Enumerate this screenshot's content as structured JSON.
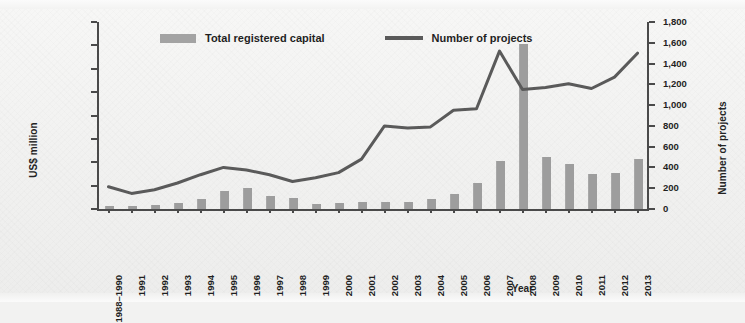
{
  "chart_data": {
    "type": "bar",
    "title": "",
    "xlabel": "Year",
    "ylabel": "US$ million",
    "y2label": "Number of projects",
    "grid": false,
    "legend_position": "top-center",
    "categories": [
      "1988–1990",
      "1991",
      "1992",
      "1993",
      "1994",
      "1995",
      "1996",
      "1997",
      "1998",
      "1999",
      "2000",
      "2001",
      "2002",
      "2003",
      "2004",
      "2005",
      "2006",
      "2007",
      "2008",
      "2009",
      "2010",
      "2011",
      "2012",
      "2013"
    ],
    "ylim": [
      0,
      80000
    ],
    "yticks": [
      0,
      10000,
      20000,
      30000,
      40000,
      50000,
      60000,
      70000,
      80000
    ],
    "ytick_labels": [
      "0",
      "10,000",
      "20,000",
      "30,000",
      "40,000",
      "50,000",
      "60,000",
      "70,000",
      "80,000"
    ],
    "y2lim": [
      0,
      1800
    ],
    "y2ticks": [
      0,
      200,
      400,
      600,
      800,
      1000,
      1200,
      1400,
      1600,
      1800
    ],
    "y2tick_labels": [
      "0",
      "200",
      "400",
      "600",
      "800",
      "1,000",
      "1,200",
      "1,400",
      "1,600",
      "1,800"
    ],
    "series": [
      {
        "name": "Total registered capital",
        "type": "bar",
        "axis": "left",
        "unit": "US$ million",
        "color": "#9d9d9d",
        "values": [
          1300,
          1100,
          1900,
          2400,
          4100,
          7600,
          9200,
          5500,
          4700,
          2100,
          2500,
          2900,
          2900,
          3000,
          4200,
          6300,
          11300,
          20500,
          70800,
          22400,
          19300,
          15000,
          15500,
          21400
        ]
      },
      {
        "name": "Number of projects",
        "type": "line",
        "axis": "right",
        "unit": "projects",
        "color": "#5a5a5a",
        "values": [
          215,
          150,
          185,
          250,
          330,
          400,
          375,
          330,
          265,
          300,
          350,
          480,
          800,
          780,
          790,
          950,
          965,
          1520,
          1150,
          1170,
          1205,
          1160,
          1270,
          1500
        ]
      }
    ]
  },
  "legend": {
    "items": [
      {
        "label": "Total registered capital",
        "marker": "bar-swatch-icon",
        "color": "#a3a3a3"
      },
      {
        "label": "Number of projects",
        "marker": "line-swatch-icon",
        "color": "#5a5a5a"
      }
    ]
  },
  "colors": {
    "background": "#f2f2f1",
    "axis": "#4a4a4a",
    "text": "#1f1f1f",
    "bar": "#9d9d9d",
    "line": "#5a5a5a"
  }
}
